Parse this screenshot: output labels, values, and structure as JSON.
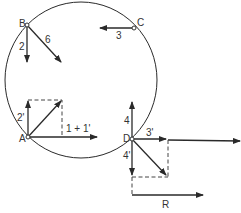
{
  "diagram": {
    "circle": {
      "cx": 81,
      "cy": 80,
      "r": 77
    },
    "points": [
      {
        "id": "B",
        "label": "B",
        "x": 27,
        "y": 25
      },
      {
        "id": "C",
        "label": "C",
        "x": 134,
        "y": 28
      },
      {
        "id": "A",
        "label": "A",
        "x": 28,
        "y": 137
      },
      {
        "id": "D",
        "label": "D",
        "x": 132,
        "y": 139
      }
    ],
    "vectors": [
      {
        "from": "B",
        "label": "2",
        "direction": "down"
      },
      {
        "from": "B",
        "label": "6",
        "direction": "down-right"
      },
      {
        "from": "C",
        "label": "3",
        "direction": "left"
      },
      {
        "from": "A",
        "label": "2'",
        "direction": "up"
      },
      {
        "from": "A",
        "label": "",
        "direction": "up-right (resultant)"
      },
      {
        "from": "A",
        "label": "1 + 1'",
        "direction": "right"
      },
      {
        "from": "D",
        "label": "4",
        "direction": "up"
      },
      {
        "from": "D",
        "label": "3'",
        "direction": "right"
      },
      {
        "from": "D",
        "label": "4'",
        "direction": "down"
      },
      {
        "from": "D",
        "label": "",
        "direction": "down-right (resultant)"
      },
      {
        "from": "offset",
        "label": "",
        "direction": "right (long)"
      },
      {
        "from": "offset",
        "label": "R",
        "direction": "right (resultant)"
      }
    ],
    "labels": {
      "B": "B",
      "C": "C",
      "A": "A",
      "D": "D",
      "v2": "2",
      "v6": "6",
      "v3": "3",
      "v2p": "2'",
      "v1p1": "1 + 1'",
      "v4": "4",
      "v3p": "3'",
      "v4p": "4'",
      "R": "R"
    }
  }
}
